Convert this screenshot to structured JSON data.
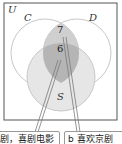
{
  "diagram": {
    "type": "venn",
    "universe_label": "U",
    "sets": [
      {
        "label": "C"
      },
      {
        "label": "D"
      },
      {
        "label": "S"
      }
    ],
    "regions": [
      {
        "location": "C∩D only",
        "value": "7"
      },
      {
        "location": "C∩D∩S",
        "value": "6"
      }
    ],
    "callouts": [
      {
        "text": "剧，喜剧电影"
      },
      {
        "text": "b 喜欢京剧"
      }
    ],
    "colors": {
      "border": "#555555",
      "circle_stroke": "#c8c8c8",
      "fill_light": "#e6e6e6",
      "fill_mid": "#cfcfcf",
      "fill_dark": "#b5b5b5",
      "pointer": "#7a7a7a"
    }
  }
}
